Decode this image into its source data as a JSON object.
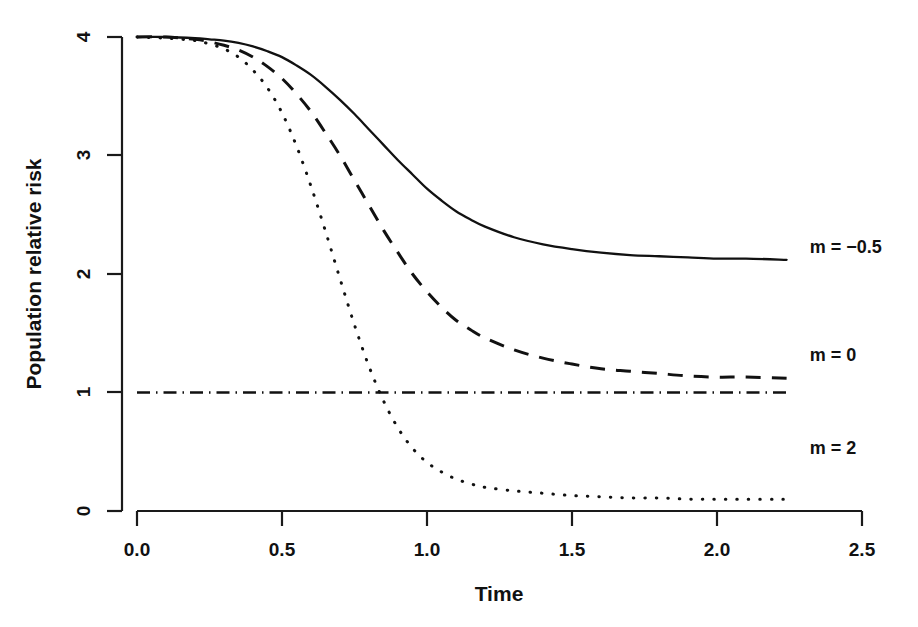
{
  "chart_data": {
    "type": "line",
    "title": "",
    "xlabel": "Time",
    "ylabel": "Population relative risk",
    "xlim": [
      0.0,
      2.5
    ],
    "ylim": [
      0,
      4
    ],
    "grid": false,
    "legend_position": "inline-right-of-curve-ends",
    "x_ticks": [
      "0.0",
      "0.5",
      "1.0",
      "1.5",
      "2.0",
      "2.5"
    ],
    "x_tick_values": [
      0.0,
      0.5,
      1.0,
      1.5,
      2.0,
      2.5
    ],
    "y_ticks": [
      "0",
      "1",
      "2",
      "3",
      "4"
    ],
    "y_tick_values": [
      0,
      1,
      2,
      3,
      4
    ],
    "x": [
      0.0,
      0.1,
      0.2,
      0.25,
      0.3,
      0.35,
      0.4,
      0.45,
      0.5,
      0.55,
      0.6,
      0.65,
      0.7,
      0.75,
      0.8,
      0.85,
      0.9,
      0.95,
      1.0,
      1.05,
      1.1,
      1.15,
      1.2,
      1.3,
      1.4,
      1.5,
      1.6,
      1.7,
      1.8,
      1.9,
      2.0,
      2.1,
      2.24
    ],
    "series": [
      {
        "name": "m = -0.5",
        "label": "m = −0.5",
        "style": "solid",
        "end_value": 2.12,
        "label_x": 2.32,
        "label_y": 2.23,
        "values": [
          4.0,
          4.0,
          3.99,
          3.98,
          3.97,
          3.95,
          3.92,
          3.88,
          3.83,
          3.76,
          3.68,
          3.58,
          3.47,
          3.35,
          3.22,
          3.09,
          2.96,
          2.84,
          2.72,
          2.62,
          2.53,
          2.46,
          2.4,
          2.31,
          2.25,
          2.21,
          2.18,
          2.16,
          2.15,
          2.14,
          2.13,
          2.13,
          2.12
        ]
      },
      {
        "name": "m = 0",
        "label": "m = 0",
        "style": "dashed",
        "end_value": 1.12,
        "label_x": 2.32,
        "label_y": 1.32,
        "values": [
          4.0,
          4.0,
          3.98,
          3.96,
          3.93,
          3.89,
          3.83,
          3.75,
          3.65,
          3.52,
          3.37,
          3.19,
          3.0,
          2.79,
          2.58,
          2.37,
          2.18,
          2.0,
          1.85,
          1.72,
          1.61,
          1.53,
          1.46,
          1.36,
          1.29,
          1.24,
          1.2,
          1.18,
          1.16,
          1.14,
          1.13,
          1.13,
          1.12
        ]
      },
      {
        "name": "m = 2",
        "label": "m = 2",
        "style": "dotted",
        "end_value": 0.1,
        "label_x": 2.32,
        "label_y": 0.53,
        "values": [
          4.0,
          3.99,
          3.97,
          3.94,
          3.9,
          3.83,
          3.72,
          3.57,
          3.36,
          3.08,
          2.74,
          2.36,
          1.96,
          1.57,
          1.22,
          0.93,
          0.7,
          0.53,
          0.41,
          0.33,
          0.27,
          0.23,
          0.2,
          0.17,
          0.15,
          0.13,
          0.12,
          0.11,
          0.11,
          0.1,
          0.1,
          0.1,
          0.1
        ]
      }
    ],
    "reference_line": {
      "name": "unity-reference",
      "style": "dashdot",
      "y_value": 1,
      "x_start": 0.0,
      "x_end": 2.24
    },
    "colors": {
      "line": "#111111",
      "axis": "#1a1a1a",
      "background": "#ffffff"
    }
  }
}
